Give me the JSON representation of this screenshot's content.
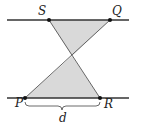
{
  "diagram": {
    "labels": {
      "S": "S",
      "Q": "Q",
      "P": "P",
      "R": "R",
      "d": "d"
    },
    "colors": {
      "line": "#333333",
      "fill": "#d9d9d9",
      "point": "#111111"
    }
  }
}
